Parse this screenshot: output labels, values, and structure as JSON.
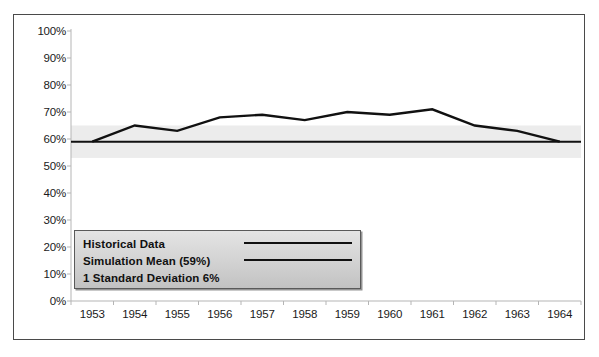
{
  "chart_data": {
    "type": "line",
    "title": "",
    "subtitle": "",
    "xlabel": "",
    "ylabel": "",
    "categories": [
      "1953",
      "1954",
      "1955",
      "1956",
      "1957",
      "1958",
      "1959",
      "1960",
      "1961",
      "1962",
      "1963",
      "1964"
    ],
    "ylim": [
      0,
      100
    ],
    "ytick_labels": [
      "100%",
      "90%",
      "80%",
      "70%",
      "60%",
      "50%",
      "40%",
      "30%",
      "20%",
      "10%",
      "0%"
    ],
    "ytick_values": [
      100,
      90,
      80,
      70,
      60,
      50,
      40,
      30,
      20,
      10,
      0
    ],
    "grid": false,
    "legend_position": "inside-lower-left",
    "series": [
      {
        "name": "Historical Data",
        "type": "line",
        "color": "#111111",
        "values": [
          59,
          65,
          63,
          68,
          69,
          67,
          70,
          69,
          71,
          65,
          63,
          59
        ]
      },
      {
        "name": "Simulation Mean (59%)",
        "type": "constant-line",
        "color": "#111111",
        "value": 59,
        "values": [
          59,
          59,
          59,
          59,
          59,
          59,
          59,
          59,
          59,
          59,
          59,
          59
        ]
      }
    ],
    "bands": [
      {
        "name": "1 Standard Deviation 6%",
        "color": "#ececec",
        "lower": 53,
        "upper": 65,
        "center": 59,
        "half_width": 6
      }
    ],
    "annotations": []
  },
  "legend": {
    "items": [
      {
        "label": "Historical Data",
        "swatch": "line",
        "color": "#111111"
      },
      {
        "label": "Simulation Mean (59%)",
        "swatch": "line",
        "color": "#111111"
      },
      {
        "label": "1 Standard Deviation 6%",
        "swatch": "none",
        "color": "#ececec"
      }
    ]
  },
  "colors": {
    "frame": "#4a4a4a",
    "line": "#111111",
    "band": "#ececec",
    "axis": "#b5b5b5",
    "text": "#1a1a1a",
    "legend_bg": "#d6d6d6"
  }
}
